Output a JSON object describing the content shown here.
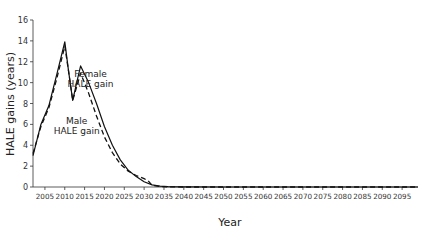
{
  "chart_data": {
    "type": "line",
    "title": "",
    "xlabel": "Year",
    "ylabel": "HALE gains (years)",
    "xlim": [
      2002,
      2099
    ],
    "ylim": [
      0,
      16
    ],
    "grid": false,
    "legend": "inline annotations",
    "y_ticks": [
      0,
      2,
      4,
      6,
      8,
      10,
      12,
      14,
      16
    ],
    "x_ticks": [
      2005,
      2010,
      2015,
      2020,
      2025,
      2030,
      2035,
      2040,
      2045,
      2050,
      2055,
      2060,
      2065,
      2070,
      2075,
      2080,
      2085,
      2090,
      2095
    ],
    "series": [
      {
        "name": "Female HALE gain",
        "style": "solid",
        "x": [
          2002,
          2004,
          2006,
          2008,
          2010,
          2011,
          2012,
          2013,
          2014,
          2016,
          2018,
          2020,
          2022,
          2024,
          2026,
          2028,
          2030,
          2032,
          2034,
          2036,
          2040,
          2050,
          2060,
          2070,
          2080,
          2090,
          2099
        ],
        "values": [
          3.0,
          6.0,
          7.8,
          10.8,
          13.9,
          11.0,
          8.3,
          10.0,
          11.6,
          10.0,
          8.0,
          5.8,
          4.0,
          2.6,
          1.6,
          1.0,
          0.5,
          0.2,
          0.08,
          0.03,
          0.01,
          0.0,
          0.0,
          0.0,
          0.0,
          0.0,
          0.0
        ]
      },
      {
        "name": "Male HALE gain",
        "style": "dashed",
        "x": [
          2002,
          2004,
          2006,
          2008,
          2010,
          2011,
          2012,
          2013,
          2014,
          2016,
          2018,
          2020,
          2022,
          2024,
          2026,
          2028,
          2030,
          2031,
          2032,
          2034,
          2036,
          2040,
          2050,
          2060,
          2070,
          2080,
          2090,
          2099
        ],
        "values": [
          3.2,
          5.8,
          7.6,
          10.4,
          13.5,
          11.0,
          8.3,
          9.6,
          10.9,
          9.0,
          6.8,
          4.8,
          3.3,
          2.2,
          1.5,
          1.1,
          0.8,
          0.6,
          0.15,
          0.05,
          0.02,
          0.0,
          0.0,
          0.0,
          0.0,
          0.0,
          0.0,
          0.0
        ]
      }
    ],
    "annotations": [
      {
        "text": [
          "Female",
          "HALE gain"
        ],
        "x": 2016.5,
        "y": 10.5
      },
      {
        "text": [
          "Male",
          "HALE gain"
        ],
        "x": 2013,
        "y": 6.0
      }
    ]
  }
}
